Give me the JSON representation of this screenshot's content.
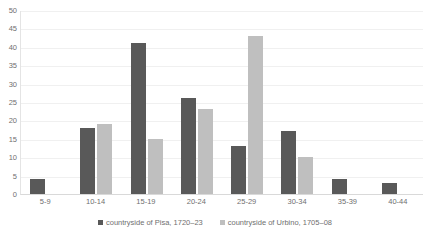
{
  "chart_data": {
    "type": "bar",
    "title": "",
    "xlabel": "",
    "ylabel": "",
    "ylim": [
      0,
      50
    ],
    "ytick_step": 5,
    "yticks": [
      50,
      45,
      40,
      35,
      30,
      25,
      20,
      15,
      10,
      5,
      0
    ],
    "grid": true,
    "legend_position": "bottom",
    "categories": [
      "5-9",
      "10-14",
      "15-19",
      "20-24",
      "25-29",
      "30-34",
      "35-39",
      "40-44"
    ],
    "series": [
      {
        "name": "countryside of Pisa, 1720–23",
        "color": "#595959",
        "values": [
          4,
          18,
          41,
          26,
          13,
          17,
          4,
          3
        ]
      },
      {
        "name": "countryside of Urbino, 1705–08",
        "color": "#bfbfbf",
        "values": [
          0,
          19,
          15,
          23,
          43,
          10,
          0,
          0
        ]
      }
    ]
  },
  "legend": {
    "items": [
      {
        "label": "countryside of Pisa, 1720–23"
      },
      {
        "label": "countryside of Urbino, 1705–08"
      }
    ]
  },
  "colors": {
    "series_pisa": "#595959",
    "series_urbino": "#bfbfbf",
    "gridline": "#f0f0f0",
    "axis": "#d9d9d9",
    "text": "#6f6f6f",
    "background": "#ffffff"
  }
}
